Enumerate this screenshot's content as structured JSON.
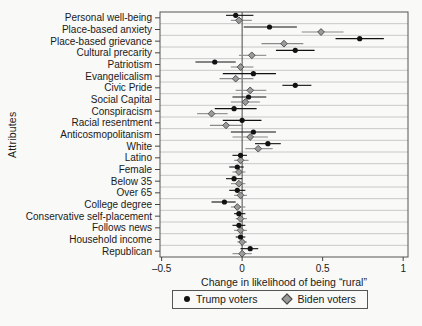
{
  "figure": {
    "background": "#f9f9f7",
    "text_color": "#1a1a1a",
    "frame_color": "#555555",
    "gridline_color": "#bcbcbc",
    "zero_line_color": "#4a4a4a"
  },
  "chart_data": {
    "type": "scatter",
    "subtype": "coefficient-dot-whisker",
    "title": "",
    "ylabel": "Attributes",
    "xlabel": "Change in likelihood of being “rural”",
    "xlim": [
      -0.51,
      1.03
    ],
    "xticks": [
      {
        "value": -0.5,
        "label": "–0.5"
      },
      {
        "value": 0,
        "label": "0"
      },
      {
        "value": 0.5,
        "label": "0.5"
      },
      {
        "value": 1,
        "label": "1"
      }
    ],
    "grid": "horizontal",
    "zero_reference_line": 0,
    "legend_position": "bottom-center",
    "categories": [
      "Personal well-being",
      "Place-based anxiety",
      "Place-based grievance",
      "Cultural precarity",
      "Patriotism",
      "Evangelicalism",
      "Civic Pride",
      "Social Capital",
      "Conspiracism",
      "Racial resentment",
      "Anticosmopolitanism",
      "White",
      "Latino",
      "Female",
      "Below 35",
      "Over 65",
      "College degree",
      "Conservative self-placement",
      "Follows news",
      "Household income",
      "Republican"
    ],
    "series": [
      {
        "name": "Trump voters",
        "marker": "circle",
        "color": "#111111",
        "ci_color": "#111111",
        "points": [
          {
            "value": -0.04,
            "lo": -0.1,
            "hi": 0.07
          },
          {
            "value": 0.17,
            "lo": 0.01,
            "hi": 0.34
          },
          {
            "value": 0.73,
            "lo": 0.58,
            "hi": 0.88
          },
          {
            "value": 0.33,
            "lo": 0.21,
            "hi": 0.45
          },
          {
            "value": -0.17,
            "lo": -0.29,
            "hi": -0.04
          },
          {
            "value": 0.07,
            "lo": -0.12,
            "hi": 0.21
          },
          {
            "value": 0.33,
            "lo": 0.25,
            "hi": 0.43
          },
          {
            "value": 0.04,
            "lo": -0.06,
            "hi": 0.15
          },
          {
            "value": -0.05,
            "lo": -0.17,
            "hi": 0.09
          },
          {
            "value": 0.0,
            "lo": -0.12,
            "hi": 0.12
          },
          {
            "value": 0.07,
            "lo": -0.07,
            "hi": 0.21
          },
          {
            "value": 0.16,
            "lo": 0.08,
            "hi": 0.24
          },
          {
            "value": -0.01,
            "lo": -0.06,
            "hi": 0.03
          },
          {
            "value": -0.03,
            "lo": -0.08,
            "hi": 0.01
          },
          {
            "value": -0.05,
            "lo": -0.1,
            "hi": 0.0
          },
          {
            "value": -0.03,
            "lo": -0.08,
            "hi": 0.02
          },
          {
            "value": -0.11,
            "lo": -0.19,
            "hi": -0.04
          },
          {
            "value": -0.02,
            "lo": -0.05,
            "hi": 0.02
          },
          {
            "value": -0.02,
            "lo": -0.06,
            "hi": 0.02
          },
          {
            "value": -0.01,
            "lo": -0.04,
            "hi": 0.02
          },
          {
            "value": 0.05,
            "lo": -0.01,
            "hi": 0.1
          }
        ]
      },
      {
        "name": "Biden voters",
        "marker": "diamond",
        "color": "#9a9a9a",
        "stroke": "#4a4a4a",
        "ci_color": "#8a8a8a",
        "points": [
          {
            "value": -0.02,
            "lo": -0.07,
            "hi": 0.06
          },
          {
            "value": 0.49,
            "lo": 0.37,
            "hi": 0.63
          },
          {
            "value": 0.26,
            "lo": 0.12,
            "hi": 0.38
          },
          {
            "value": 0.06,
            "lo": -0.02,
            "hi": 0.15
          },
          {
            "value": -0.01,
            "lo": -0.07,
            "hi": 0.07
          },
          {
            "value": -0.04,
            "lo": -0.14,
            "hi": 0.07
          },
          {
            "value": 0.05,
            "lo": -0.04,
            "hi": 0.15
          },
          {
            "value": 0.02,
            "lo": -0.07,
            "hi": 0.11
          },
          {
            "value": -0.19,
            "lo": -0.28,
            "hi": -0.09
          },
          {
            "value": -0.1,
            "lo": -0.2,
            "hi": 0.0
          },
          {
            "value": 0.05,
            "lo": -0.06,
            "hi": 0.16
          },
          {
            "value": 0.1,
            "lo": 0.02,
            "hi": 0.19
          },
          {
            "value": -0.01,
            "lo": -0.05,
            "hi": 0.04
          },
          {
            "value": -0.02,
            "lo": -0.06,
            "hi": 0.02
          },
          {
            "value": -0.02,
            "lo": -0.07,
            "hi": 0.02
          },
          {
            "value": -0.01,
            "lo": -0.05,
            "hi": 0.03
          },
          {
            "value": -0.03,
            "lo": -0.07,
            "hi": 0.02
          },
          {
            "value": -0.01,
            "lo": -0.04,
            "hi": 0.03
          },
          {
            "value": -0.01,
            "lo": -0.05,
            "hi": 0.03
          },
          {
            "value": 0.0,
            "lo": -0.03,
            "hi": 0.03
          },
          {
            "value": 0.0,
            "lo": -0.06,
            "hi": 0.06
          }
        ]
      }
    ]
  }
}
